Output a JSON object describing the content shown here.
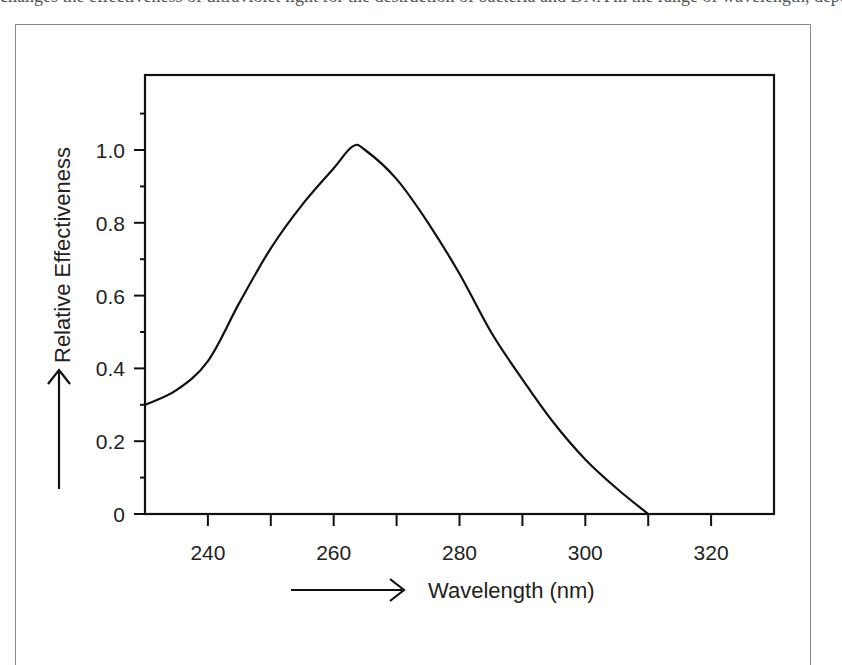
{
  "figure": {
    "top_text": "changes the effectiveness of ultraviolet light for the destruction of bacteria and DNA in the range of wavelength, depend"
  },
  "chart_data": {
    "type": "line",
    "title": "",
    "xlabel": "Wavelength (nm)",
    "ylabel": "Relative Effectiveness",
    "xlim": [
      230,
      330
    ],
    "ylim": [
      0,
      1.2
    ],
    "x_ticks": [
      240,
      260,
      280,
      300,
      320
    ],
    "x_tick_labels": [
      "240",
      "260",
      "280",
      "300",
      "320"
    ],
    "x_minor_ticks": [
      250,
      270,
      290,
      310
    ],
    "y_ticks": [
      0,
      0.2,
      0.4,
      0.6,
      0.8,
      1.0
    ],
    "y_tick_labels": [
      "0",
      "0.2",
      "0.4",
      "0.6",
      "0.8",
      "1.0"
    ],
    "y_minor_ticks": [
      0.1,
      0.3,
      0.5,
      0.7,
      0.9,
      1.1
    ],
    "grid": false,
    "legend": null,
    "series": [
      {
        "name": "Relative Effectiveness",
        "x": [
          230,
          235,
          240,
          245,
          250,
          255,
          260,
          263,
          265,
          270,
          275,
          280,
          285,
          290,
          295,
          300,
          305,
          310
        ],
        "values": [
          0.3,
          0.34,
          0.42,
          0.58,
          0.73,
          0.85,
          0.95,
          1.01,
          1.0,
          0.92,
          0.8,
          0.66,
          0.5,
          0.37,
          0.25,
          0.15,
          0.07,
          0.0
        ]
      }
    ],
    "annotations": [
      {
        "type": "arrow",
        "direction": "up",
        "position": "left of y-axis title"
      },
      {
        "type": "arrow",
        "direction": "right",
        "position": "left of x-axis title"
      }
    ]
  }
}
